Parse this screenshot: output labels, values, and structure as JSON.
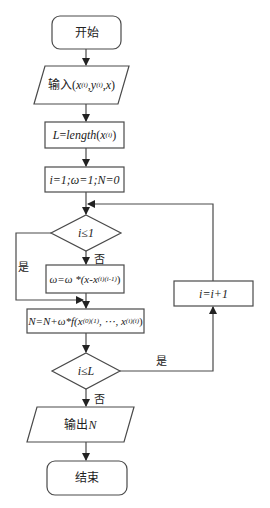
{
  "flowchart": {
    "start": {
      "label": "开始"
    },
    "input": {
      "prefix": "输入",
      "expr_open": "(",
      "x": "x",
      "x_sub": "(i)",
      "sep1": ", ",
      "y": "y",
      "y_sub": "(i)",
      "sep2": ", ",
      "x2": "x",
      "expr_close": ")"
    },
    "length_step": {
      "lhs": "L",
      "eq": "=",
      "fn": "length",
      "open": "(",
      "arg": "x",
      "arg_sub": "(i)",
      "close": ")"
    },
    "init_step": {
      "text": "i=1;ω=1;N=0"
    },
    "decision1": {
      "condition": "i≤1",
      "yes_label": "是",
      "no_label": "否"
    },
    "omega_step": {
      "main": "ω=ω *(x-x",
      "sub": "(i)(i-1)",
      "close": ")"
    },
    "sum_step": {
      "main": "N=N+ω*f(x",
      "sub1": "(0)(1)",
      "mid": ", ⋯, x",
      "sub2": "(i)(i)",
      "close": ")"
    },
    "increment_step": {
      "text": "i=i+1"
    },
    "decision2": {
      "condition": "i≤L",
      "yes_label": "是",
      "no_label": "否"
    },
    "output": {
      "prefix": "输出",
      "var": "N"
    },
    "end": {
      "label": "结束"
    }
  },
  "colors": {
    "stroke": "#4a4a4a",
    "text": "#222222",
    "background": "#ffffff"
  }
}
